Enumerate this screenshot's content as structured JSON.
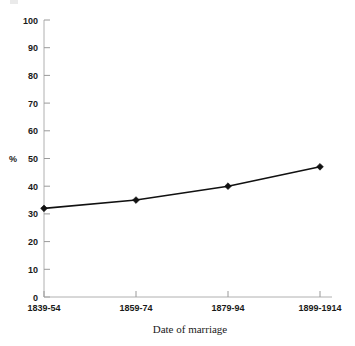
{
  "chart_data": {
    "type": "line",
    "title": "",
    "subtitle": "",
    "categories": [
      "1839-54",
      "1859-74",
      "1879-94",
      "1899-1914"
    ],
    "values": [
      32,
      35,
      40,
      47
    ],
    "series": [
      {
        "name": "",
        "values": [
          32,
          35,
          40,
          47
        ]
      }
    ],
    "xlabel": "Date of marriage",
    "ylabel": "%",
    "ylim": [
      0,
      100
    ],
    "ytick_labels": [
      "0",
      "10",
      "20",
      "30",
      "40",
      "50",
      "60",
      "70",
      "80",
      "90",
      "100"
    ],
    "ytick_values": [
      0,
      10,
      20,
      30,
      40,
      50,
      60,
      70,
      80,
      90,
      100
    ],
    "xtick_labels": [
      "1839-54",
      "1859-74",
      "1879-94",
      "1899-1914"
    ],
    "grid": false,
    "legend": "none",
    "marker": "diamond",
    "line_color": "#111111",
    "marker_color": "#111111",
    "axis_color": "#b0b0b0"
  }
}
